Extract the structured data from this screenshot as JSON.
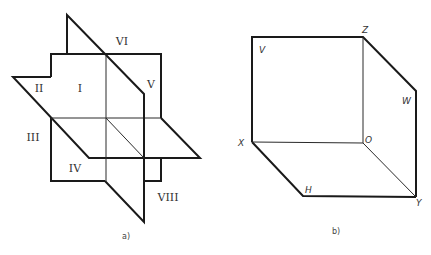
{
  "panel_a": {
    "caption": "a)",
    "octant_labels": {
      "I": "I",
      "II": "II",
      "III": "III",
      "IV": "IV",
      "V": "V",
      "VI": "VI",
      "VIII": "VIII"
    }
  },
  "panel_b": {
    "caption": "b)",
    "labels": {
      "V": "V",
      "Z": "Z",
      "W": "W",
      "X": "X",
      "O": "O",
      "H": "H",
      "Y": "Y"
    }
  }
}
